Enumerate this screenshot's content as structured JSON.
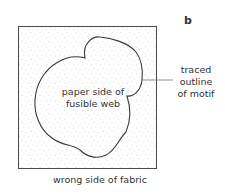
{
  "diagram": {
    "panel_label": "b",
    "rectangle_label": "wrong side of fabric",
    "shape_label_line1": "paper side of",
    "shape_label_line2": "fusible web",
    "leader_label_line1": "traced",
    "leader_label_line2": "outline",
    "leader_label_line3": "of motif",
    "colors": {
      "outline": "#3a3a3a",
      "stipple": "#b8b8b8",
      "leader": "#777777"
    }
  }
}
